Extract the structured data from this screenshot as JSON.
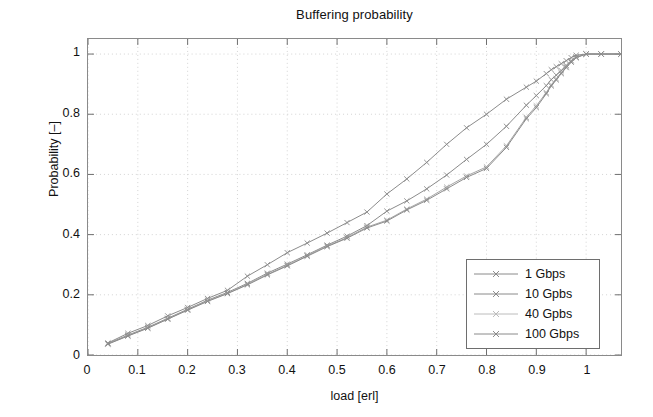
{
  "chart_data": {
    "type": "line",
    "title": "Buffering probability",
    "xlabel": "load [erl]",
    "ylabel": "Probability [–]",
    "xlim": [
      0,
      1.07
    ],
    "ylim": [
      0,
      1.05
    ],
    "xticks": [
      "0",
      "0.1",
      "0.2",
      "0.3",
      "0.4",
      "0.5",
      "0.6",
      "0.7",
      "0.8",
      "0.9",
      "1"
    ],
    "xtick_values": [
      0,
      0.1,
      0.2,
      0.3,
      0.4,
      0.5,
      0.6,
      0.7,
      0.8,
      0.9,
      1.0
    ],
    "yticks": [
      "0",
      "0.2",
      "0.4",
      "0.6",
      "0.8",
      "1"
    ],
    "ytick_values": [
      0,
      0.2,
      0.4,
      0.6,
      0.8,
      1.0
    ],
    "grid": true,
    "grid_style": "dotted",
    "grid_color": "#c9c9c9",
    "legend_position": "lower right",
    "marker": "x",
    "line_color": "#8a8a8a",
    "series": [
      {
        "name": "1 Gbps",
        "color": "#8a8a8a",
        "x": [
          0.04,
          0.08,
          0.12,
          0.16,
          0.2,
          0.24,
          0.28,
          0.32,
          0.36,
          0.4,
          0.44,
          0.48,
          0.52,
          0.56,
          0.6,
          0.64,
          0.68,
          0.72,
          0.76,
          0.8,
          0.84,
          0.88,
          0.9,
          0.92,
          0.93,
          0.94,
          0.95,
          0.96,
          0.97,
          0.98,
          1.0,
          1.03,
          1.07
        ],
        "y": [
          0.04,
          0.072,
          0.098,
          0.13,
          0.158,
          0.188,
          0.215,
          0.262,
          0.3,
          0.34,
          0.372,
          0.405,
          0.44,
          0.475,
          0.535,
          0.585,
          0.64,
          0.7,
          0.755,
          0.8,
          0.85,
          0.89,
          0.91,
          0.935,
          0.948,
          0.958,
          0.968,
          0.978,
          0.988,
          0.996,
          1.0,
          1.0,
          1.0
        ]
      },
      {
        "name": "10 Gpbs",
        "color": "#8a8a8a",
        "x": [
          0.04,
          0.08,
          0.12,
          0.16,
          0.2,
          0.24,
          0.28,
          0.32,
          0.36,
          0.4,
          0.44,
          0.48,
          0.52,
          0.56,
          0.6,
          0.64,
          0.68,
          0.72,
          0.76,
          0.8,
          0.84,
          0.88,
          0.9,
          0.92,
          0.93,
          0.94,
          0.95,
          0.96,
          0.97,
          0.98,
          1.0,
          1.03,
          1.07
        ],
        "y": [
          0.038,
          0.066,
          0.092,
          0.122,
          0.152,
          0.182,
          0.208,
          0.238,
          0.272,
          0.302,
          0.333,
          0.365,
          0.395,
          0.43,
          0.478,
          0.512,
          0.552,
          0.598,
          0.65,
          0.7,
          0.76,
          0.83,
          0.862,
          0.895,
          0.915,
          0.93,
          0.945,
          0.962,
          0.978,
          0.99,
          1.0,
          1.0,
          1.0
        ]
      },
      {
        "name": "40 Gpbs",
        "color": "#a5a5a5",
        "x": [
          0.04,
          0.08,
          0.12,
          0.16,
          0.2,
          0.24,
          0.28,
          0.32,
          0.36,
          0.4,
          0.44,
          0.48,
          0.52,
          0.56,
          0.6,
          0.64,
          0.68,
          0.72,
          0.76,
          0.8,
          0.84,
          0.88,
          0.9,
          0.92,
          0.93,
          0.94,
          0.95,
          0.96,
          0.97,
          0.98,
          1.0,
          1.03,
          1.07
        ],
        "y": [
          0.037,
          0.064,
          0.09,
          0.12,
          0.15,
          0.18,
          0.205,
          0.235,
          0.268,
          0.298,
          0.33,
          0.362,
          0.39,
          0.425,
          0.448,
          0.485,
          0.518,
          0.558,
          0.595,
          0.625,
          0.695,
          0.79,
          0.828,
          0.872,
          0.898,
          0.918,
          0.938,
          0.958,
          0.975,
          0.989,
          1.0,
          1.0,
          1.0
        ]
      },
      {
        "name": "100 Gbps",
        "color": "#8a8a8a",
        "x": [
          0.04,
          0.08,
          0.12,
          0.16,
          0.2,
          0.24,
          0.28,
          0.32,
          0.36,
          0.4,
          0.44,
          0.48,
          0.52,
          0.56,
          0.6,
          0.64,
          0.68,
          0.72,
          0.76,
          0.8,
          0.84,
          0.88,
          0.9,
          0.92,
          0.93,
          0.94,
          0.95,
          0.96,
          0.97,
          0.98,
          1.0,
          1.03,
          1.07
        ],
        "y": [
          0.036,
          0.063,
          0.089,
          0.119,
          0.149,
          0.178,
          0.204,
          0.233,
          0.266,
          0.296,
          0.328,
          0.36,
          0.388,
          0.422,
          0.445,
          0.482,
          0.514,
          0.552,
          0.59,
          0.62,
          0.69,
          0.785,
          0.822,
          0.868,
          0.894,
          0.914,
          0.935,
          0.955,
          0.973,
          0.988,
          1.0,
          1.0,
          1.0
        ]
      }
    ]
  }
}
